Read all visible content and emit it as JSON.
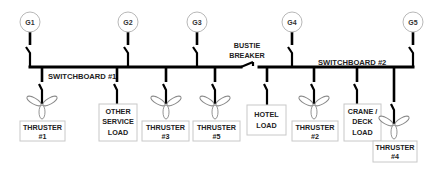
{
  "diagram": {
    "generators": [
      {
        "id": "G1",
        "label": "G1",
        "x": 30
      },
      {
        "id": "G2",
        "label": "G2",
        "x": 128
      },
      {
        "id": "G3",
        "label": "G3",
        "x": 197
      },
      {
        "id": "G4",
        "label": "G4",
        "x": 292
      },
      {
        "id": "G5",
        "label": "G5",
        "x": 413
      }
    ],
    "switchboards": [
      {
        "id": "sb1",
        "label": "SWITCHBOARD #1"
      },
      {
        "id": "sb2",
        "label": "SWITCHBOARD #2"
      }
    ],
    "bustie": {
      "line1": "BUSTIE",
      "line2": "BREAKER"
    },
    "loads": [
      {
        "id": "thruster1",
        "type": "thruster",
        "lines": [
          "THRUSTER",
          "#1"
        ],
        "x": 42
      },
      {
        "id": "other-service",
        "type": "load",
        "lines": [
          "OTHER",
          "SERVICE",
          "LOAD"
        ],
        "x": 117
      },
      {
        "id": "thruster3",
        "type": "thruster",
        "lines": [
          "THRUSTER",
          "#3"
        ],
        "x": 166
      },
      {
        "id": "thruster5",
        "type": "thruster",
        "lines": [
          "THRUSTER",
          "#5"
        ],
        "x": 215
      },
      {
        "id": "hotel",
        "type": "load",
        "lines": [
          "HOTEL",
          "LOAD"
        ],
        "x": 267
      },
      {
        "id": "thruster2",
        "type": "thruster",
        "lines": [
          "THRUSTER",
          "#2"
        ],
        "x": 314
      },
      {
        "id": "crane-deck",
        "type": "load",
        "lines": [
          "CRANE /",
          "DECK",
          "LOAD"
        ],
        "x": 357
      },
      {
        "id": "thruster4",
        "type": "thruster",
        "lines": [
          "THRUSTER",
          "#4"
        ],
        "x": 394
      }
    ]
  }
}
